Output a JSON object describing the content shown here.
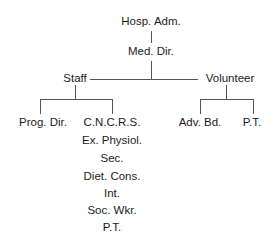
{
  "diagram": {
    "type": "org-chart",
    "root": {
      "label": "Hosp. Adm.",
      "child": {
        "label": "Med. Dir.",
        "branches": [
          {
            "label": "Staff",
            "children": [
              {
                "label": "Prog. Dir."
              },
              {
                "label": "C.N.C.R.S.",
                "list": [
                  "Ex. Physiol.",
                  "Sec.",
                  "Diet. Cons.",
                  "Int.",
                  "Soc. Wkr.",
                  "P.T."
                ]
              }
            ]
          },
          {
            "label": "Volunteer",
            "children": [
              {
                "label": "Adv. Bd."
              },
              {
                "label": "P.T."
              }
            ]
          }
        ]
      }
    }
  },
  "colors": {
    "text": "#1c1c1c",
    "lines": "#555555",
    "background": "#ffffff"
  }
}
